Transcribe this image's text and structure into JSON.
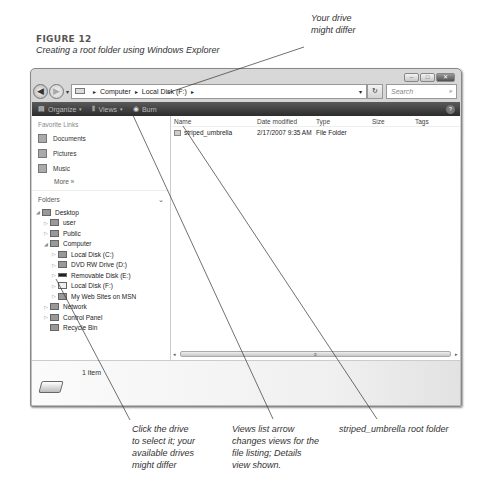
{
  "figure": {
    "title": "FIGURE 12",
    "subtitle": "Creating a root folder using Windows Explorer"
  },
  "callouts": {
    "drive": "Your drive might differ",
    "drive_lines": [
      "Your drive",
      "might differ"
    ],
    "click_drive": [
      "Click the drive",
      "to select it; your",
      "available drives",
      "might differ"
    ],
    "views": [
      "Views list arrow",
      "changes views for the",
      "file listing; Details",
      "view shown."
    ],
    "folder": "striped_umbrella root folder"
  },
  "window": {
    "controls": {
      "minimize": "–",
      "maximize": "□",
      "close": "✕"
    },
    "nav": {
      "back_icon": "◀",
      "forward_icon": "▶",
      "dropdown_icon": "▾"
    },
    "address": {
      "crumbs": [
        "Computer",
        "Local Disk (F:)"
      ],
      "sep": "▸",
      "dropdown_icon": "▾",
      "refresh_icon": "↻"
    },
    "search": {
      "placeholder": "Search",
      "icon": "⌕"
    },
    "toolbar": {
      "organize": "Organize",
      "views": "Views",
      "burn": "Burn",
      "dd": "▾",
      "help": "?"
    },
    "sidebar": {
      "favorites_header": "Favorite Links",
      "favorites": [
        {
          "label": "Documents"
        },
        {
          "label": "Pictures"
        },
        {
          "label": "Music"
        }
      ],
      "more": "More »",
      "folders_header": "Folders",
      "folders_chevron": "⌄",
      "tree": [
        {
          "label": "Desktop",
          "indent": 0,
          "exp": "◢"
        },
        {
          "label": "user",
          "indent": 1,
          "exp": "▷"
        },
        {
          "label": "Public",
          "indent": 1,
          "exp": "▷"
        },
        {
          "label": "Computer",
          "indent": 1,
          "exp": "◢"
        },
        {
          "label": "Local Disk (C:)",
          "indent": 2,
          "exp": "▷"
        },
        {
          "label": "DVD RW Drive (D:)",
          "indent": 2,
          "exp": "▷"
        },
        {
          "label": "Removable Disk (E:)",
          "indent": 2,
          "exp": "▷"
        },
        {
          "label": "Local Disk (F:)",
          "indent": 2,
          "exp": "▷"
        },
        {
          "label": "My Web Sites on MSN",
          "indent": 2,
          "exp": "▷"
        },
        {
          "label": "Network",
          "indent": 1,
          "exp": "▷"
        },
        {
          "label": "Control Panel",
          "indent": 1,
          "exp": "▷"
        },
        {
          "label": "Recycle Bin",
          "indent": 1,
          "exp": ""
        }
      ]
    },
    "columns": [
      "Name",
      "Date modified",
      "Type",
      "Size",
      "Tags"
    ],
    "files": [
      {
        "name": "striped_umbrella",
        "date": "2/17/2007 9:35 AM",
        "type": "File Folder",
        "size": "",
        "tags": ""
      }
    ],
    "scroll": {
      "left": "◂",
      "right": "▸",
      "grip": "≡"
    },
    "status": {
      "count": "1 item"
    }
  }
}
